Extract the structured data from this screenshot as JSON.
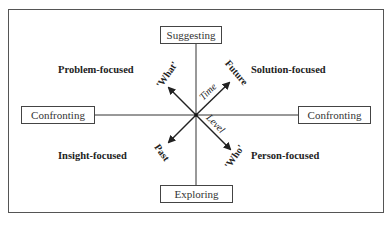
{
  "boxes": {
    "top": "Suggesting",
    "bottom": "Exploring",
    "left": "Confronting",
    "right": "Confronting"
  },
  "quadrants": {
    "top_left": "Problem-focused",
    "top_right": "Solution-focused",
    "bottom_left": "Insight-focused",
    "bottom_right": "Person-focused"
  },
  "axes": {
    "time_axis_label": "Time",
    "level_axis_label": "Level",
    "arrow_ends": {
      "up_right": "Future",
      "down_left": "Past",
      "up_left": "'What'",
      "down_right": "'Who'"
    }
  }
}
